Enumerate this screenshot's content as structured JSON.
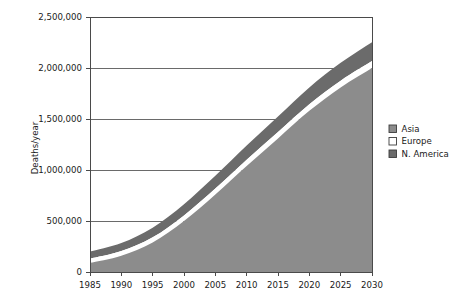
{
  "chart_data": {
    "type": "area",
    "stacked": true,
    "title": "",
    "xlabel": "",
    "ylabel": "Deaths/year",
    "x": [
      1985,
      1990,
      1995,
      2000,
      2005,
      2010,
      2015,
      2020,
      2025,
      2030
    ],
    "categories": [
      "1985",
      "1990",
      "1995",
      "2000",
      "2005",
      "2010",
      "2015",
      "2020",
      "2025",
      "2030"
    ],
    "xtick_labels": [
      "1985",
      "1990",
      "1995",
      "2000",
      "2005",
      "2010",
      "2015",
      "2020",
      "2025",
      "2030"
    ],
    "ytick_labels": [
      "0",
      "500,000",
      "1,000,000",
      "1,500,000",
      "2,000,000",
      "2,500,000"
    ],
    "ytick_values": [
      0,
      500000,
      1000000,
      1500000,
      2000000,
      2500000
    ],
    "xlim": [
      1985,
      2030
    ],
    "ylim": [
      0,
      2500000
    ],
    "grid": true,
    "grid_axis": "y",
    "legend_position": "right",
    "series": [
      {
        "name": "Asia",
        "color": "#8c8c8c",
        "values": [
          90000,
          160000,
          290000,
          500000,
          760000,
          1040000,
          1310000,
          1580000,
          1810000,
          2000000
        ]
      },
      {
        "name": "Europe",
        "color": "#ffffff",
        "values": [
          40000,
          45000,
          50000,
          55000,
          58000,
          60000,
          62000,
          64000,
          66000,
          68000
        ]
      },
      {
        "name": "N. America",
        "color": "#6b6b6b",
        "values": [
          70000,
          80000,
          95000,
          110000,
          125000,
          140000,
          152000,
          165000,
          175000,
          185000
        ]
      }
    ],
    "totals": [
      200000,
      285000,
      435000,
      665000,
      943000,
      1240000,
      1524000,
      1809000,
      2051000,
      2253000
    ]
  },
  "legend": {
    "items": [
      {
        "label": "Asia",
        "color": "#8c8c8c"
      },
      {
        "label": "Europe",
        "color": "#ffffff"
      },
      {
        "label": "N. America",
        "color": "#6b6b6b"
      }
    ]
  },
  "axes": {
    "y_title": "Deaths/year"
  }
}
